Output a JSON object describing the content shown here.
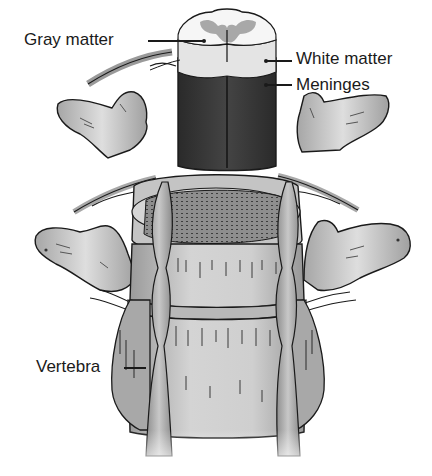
{
  "figure": {
    "labels": {
      "gray_matter": "Gray matter",
      "white_matter": "White matter",
      "meninges": "Meninges",
      "vertebra": "Vertebra"
    }
  },
  "colors": {
    "background": "#ffffff",
    "outline": "#1a1a1a",
    "bone_light": "#d8d8d8",
    "bone_mid": "#b4b4b4",
    "bone_dark": "#8a8a8a",
    "gray_matter": "#a8a8a8",
    "white_matter": "#f2f2f2",
    "meninges": "#3a3a3a",
    "disc": "#6e6e6e"
  }
}
